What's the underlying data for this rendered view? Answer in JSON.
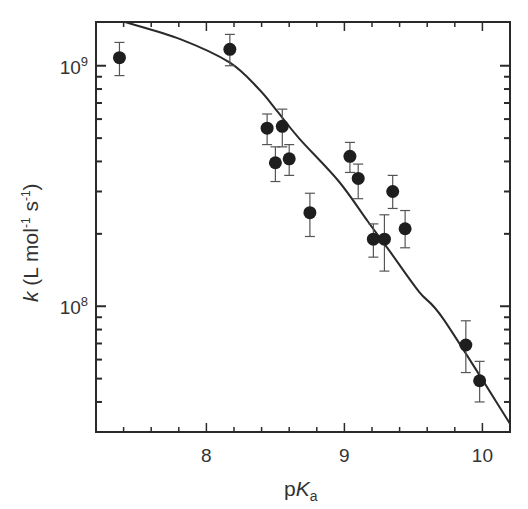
{
  "chart_data": {
    "type": "scatter",
    "title": "",
    "xlabel": "pKa",
    "xlabel_parts": {
      "prefix": "p",
      "italic": "K",
      "subscript": "a"
    },
    "ylabel": "k (L mol-1 s-1)",
    "ylabel_parts": {
      "italic": "k",
      "rest": " (L mol",
      "sup1": "-1",
      "mid": " s",
      "sup2": "-1",
      "end": ")"
    },
    "xlim": [
      7.2,
      10.2
    ],
    "ylim": [
      30000000.0,
      1520000000.0
    ],
    "yscale": "log",
    "grid": false,
    "legend": null,
    "x_ticks": [
      {
        "value": 8,
        "label": "8"
      },
      {
        "value": 9,
        "label": "9"
      },
      {
        "value": 10,
        "label": "10"
      }
    ],
    "x_minor_step": 0.2,
    "y_ticks": [
      {
        "value": 100000000.0,
        "base": "10",
        "exp": "8"
      },
      {
        "value": 1000000000.0,
        "base": "10",
        "exp": "9"
      }
    ],
    "series": [
      {
        "name": "measured",
        "marker": "filled-circle",
        "color": "#1e1e1e",
        "points": [
          {
            "x": 7.37,
            "y": 1080000000.0,
            "err_low": 910000000.0,
            "err_high": 1250000000.0
          },
          {
            "x": 8.17,
            "y": 1170000000.0,
            "err_low": 1000000000.0,
            "err_high": 1350000000.0
          },
          {
            "x": 8.44,
            "y": 550000000.0,
            "err_low": 470000000.0,
            "err_high": 630000000.0
          },
          {
            "x": 8.5,
            "y": 395000000.0,
            "err_low": 330000000.0,
            "err_high": 460000000.0
          },
          {
            "x": 8.55,
            "y": 560000000.0,
            "err_low": 460000000.0,
            "err_high": 660000000.0
          },
          {
            "x": 8.6,
            "y": 410000000.0,
            "err_low": 350000000.0,
            "err_high": 470000000.0
          },
          {
            "x": 8.75,
            "y": 245000000.0,
            "err_low": 195000000.0,
            "err_high": 295000000.0
          },
          {
            "x": 9.04,
            "y": 420000000.0,
            "err_low": 360000000.0,
            "err_high": 480000000.0
          },
          {
            "x": 9.1,
            "y": 340000000.0,
            "err_low": 280000000.0,
            "err_high": 390000000.0
          },
          {
            "x": 9.21,
            "y": 190000000.0,
            "err_low": 160000000.0,
            "err_high": 220000000.0
          },
          {
            "x": 9.29,
            "y": 190000000.0,
            "err_low": 140000000.0,
            "err_high": 240000000.0
          },
          {
            "x": 9.35,
            "y": 300000000.0,
            "err_low": 255000000.0,
            "err_high": 350000000.0
          },
          {
            "x": 9.44,
            "y": 210000000.0,
            "err_low": 175000000.0,
            "err_high": 250000000.0
          },
          {
            "x": 9.88,
            "y": 69000000.0,
            "err_low": 53000000.0,
            "err_high": 87000000.0
          },
          {
            "x": 9.98,
            "y": 49000000.0,
            "err_low": 40000000.0,
            "err_high": 59000000.0
          }
        ]
      },
      {
        "name": "fit",
        "type": "line",
        "color": "#2a2a2a",
        "points": [
          {
            "x": 7.41,
            "y": 1520000000.0
          },
          {
            "x": 7.81,
            "y": 1290000000.0
          },
          {
            "x": 8.17,
            "y": 1030000000.0
          },
          {
            "x": 8.38,
            "y": 800000000.0
          },
          {
            "x": 8.52,
            "y": 640000000.0
          },
          {
            "x": 8.67,
            "y": 500000000.0
          },
          {
            "x": 8.96,
            "y": 330000000.0
          },
          {
            "x": 9.17,
            "y": 225000000.0
          },
          {
            "x": 9.32,
            "y": 172000000.0
          },
          {
            "x": 9.54,
            "y": 115000000.0
          },
          {
            "x": 9.72,
            "y": 88000000.0
          },
          {
            "x": 10.2,
            "y": 32500000.0
          }
        ]
      }
    ]
  }
}
